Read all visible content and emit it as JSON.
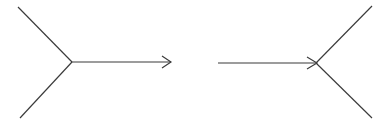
{
  "figure": {
    "type": "diagram",
    "canvas": {
      "width": 389,
      "height": 124,
      "background_color": "#ffffff"
    },
    "style": {
      "line_color": "#3a3a3a",
      "line_width": 1.15,
      "arrow_style": "open-chevron"
    },
    "diagrams": [
      {
        "id": "left-vertex-diagram",
        "name": "outgoing-arrow-vertex",
        "vertex": {
          "x": 72,
          "y": 62
        },
        "arrow_direction": "right",
        "arrow_tip": {
          "x": 171,
          "y": 62
        },
        "branches": [
          {
            "name": "upper-left-branch",
            "from": {
              "x": 72,
              "y": 62
            },
            "to": {
              "x": 18,
              "y": 7
            }
          },
          {
            "name": "lower-left-branch",
            "from": {
              "x": 72,
              "y": 62
            },
            "to": {
              "x": 20,
              "y": 118
            }
          },
          {
            "name": "horizontal-arrow-branch",
            "from": {
              "x": 72,
              "y": 62
            },
            "to": {
              "x": 171,
              "y": 62
            }
          }
        ],
        "arrow_head": {
          "name": "right-chevron-arrowhead",
          "tip": {
            "x": 171,
            "y": 62
          },
          "upper_tail": {
            "x": 162,
            "y": 56
          },
          "lower_tail": {
            "x": 162,
            "y": 68
          }
        }
      },
      {
        "id": "right-vertex-diagram",
        "name": "incoming-arrow-vertex",
        "vertex": {
          "x": 316,
          "y": 63
        },
        "arrow_direction": "right",
        "arrow_tip": {
          "x": 316,
          "y": 63
        },
        "branches": [
          {
            "name": "horizontal-arrow-branch",
            "from": {
              "x": 218,
              "y": 63
            },
            "to": {
              "x": 316,
              "y": 63
            }
          },
          {
            "name": "upper-right-branch",
            "from": {
              "x": 316,
              "y": 63
            },
            "to": {
              "x": 372,
              "y": 6
            }
          },
          {
            "name": "lower-right-branch",
            "from": {
              "x": 316,
              "y": 63
            },
            "to": {
              "x": 372,
              "y": 118
            }
          }
        ],
        "arrow_head": {
          "name": "right-chevron-arrowhead",
          "tip": {
            "x": 317,
            "y": 63
          },
          "upper_tail": {
            "x": 307,
            "y": 57
          },
          "lower_tail": {
            "x": 307,
            "y": 69
          }
        }
      }
    ]
  }
}
